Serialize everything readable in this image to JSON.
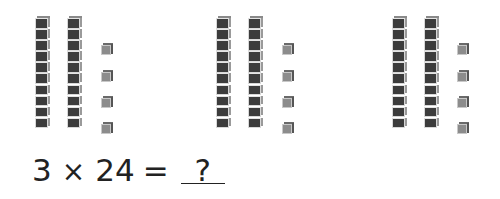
{
  "diagram": {
    "type": "base-ten blocks multiplication model",
    "groups": [
      {
        "tens": 2,
        "ones": 4,
        "x": 35
      },
      {
        "tens": 2,
        "ones": 4,
        "x": 216
      },
      {
        "tens": 2,
        "ones": 4,
        "x": 392
      }
    ],
    "colors": {
      "ten_rod": "#3c3c3c",
      "unit_cube": "#8c8c8c"
    }
  },
  "equation": {
    "factor1": "3",
    "operator": "×",
    "factor2": "24",
    "equals": "=",
    "answer": "?"
  }
}
